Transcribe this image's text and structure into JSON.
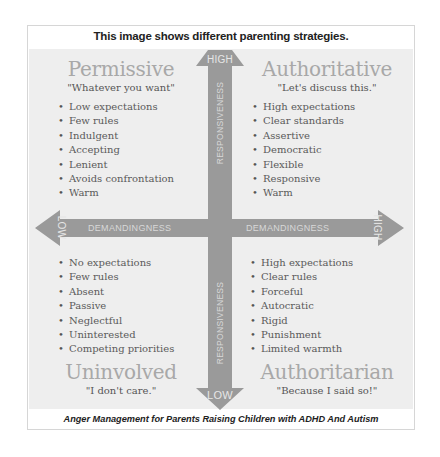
{
  "header": {
    "title": "This image  shows  different parenting strategies."
  },
  "footer": {
    "caption": "Anger Management for Parents Raising Children with ADHD And Autism"
  },
  "axes": {
    "vertical": {
      "name": "RESPONSIVENESS",
      "high_label": "HIGH",
      "low_label": "LOW"
    },
    "horizontal": {
      "name_left": "DEMANDINGNESS",
      "name_right": "DEMANDINGNESS",
      "high_label": "HIGH",
      "low_label": "LOW"
    }
  },
  "quadrants": {
    "permissive": {
      "title": "Permissive",
      "quote": "\"Whatever you want\"",
      "items": [
        "Low expectations",
        "Few rules",
        "Indulgent",
        "Accepting",
        "Lenient",
        "Avoids confrontation",
        "Warm"
      ]
    },
    "authoritative": {
      "title": "Authoritative",
      "quote": "\"Let's discuss this.\"",
      "items": [
        "High expectations",
        "Clear standards",
        "Assertive",
        "Democratic",
        "Flexible",
        "Responsive",
        "Warm"
      ]
    },
    "uninvolved": {
      "title": "Uninvolved",
      "quote": "\"I don't care.\"",
      "items": [
        "No expectations",
        "Few rules",
        "Absent",
        "Passive",
        "Neglectful",
        "Uninterested",
        "Competing priorities"
      ]
    },
    "authoritarian": {
      "title": "Authoritarian",
      "quote": "\"Because I said so!\"",
      "items": [
        "High expectations",
        "Clear rules",
        "Forceful",
        "Autocratic",
        "Rigid",
        "Punishment",
        "Limited warmth"
      ]
    }
  },
  "colors": {
    "arrow": "#9a9a9a",
    "panel": "#eeeeee",
    "quadrant_title": "#a8a8a8"
  }
}
